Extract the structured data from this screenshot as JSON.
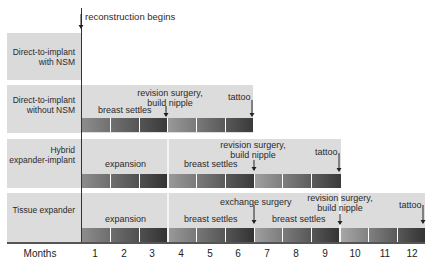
{
  "annotation_top": "reconstruction begins",
  "rows": [
    {
      "label_line1": "Direct-to-implant",
      "label_line2": "with NSM"
    },
    {
      "label_line1": "Direct-to-implant",
      "label_line2": "without NSM",
      "events": {
        "breast_settles": "breast settles",
        "revision_l1": "revision surgery,",
        "revision_l2": "build nipple",
        "tattoo": "tattoo"
      }
    },
    {
      "label_line1": "Hybrid",
      "label_line2": "expander-implant",
      "events": {
        "expansion": "expansion",
        "breast_settles": "breast settles",
        "revision_l1": "revision surgery,",
        "revision_l2": "build nipple",
        "tattoo": "tattoo"
      }
    },
    {
      "label_line1": "Tissue expander",
      "label_line2": "",
      "events": {
        "expansion": "expansion",
        "breast_settles_1": "breast settles",
        "exchange": "exchange surgery",
        "breast_settles_2": "breast settles",
        "revision_l1": "revision surgery,",
        "revision_l2": "build nipple",
        "tattoo": "tattoo"
      }
    }
  ],
  "axis": {
    "label": "Months",
    "ticks": [
      "1",
      "2",
      "3",
      "4",
      "5",
      "6",
      "7",
      "8",
      "9",
      "10",
      "11",
      "12"
    ]
  },
  "colors": {
    "row_bg": "#dcdcdc",
    "bar_light": "#8c8c8c",
    "bar_dark": "#353535"
  }
}
